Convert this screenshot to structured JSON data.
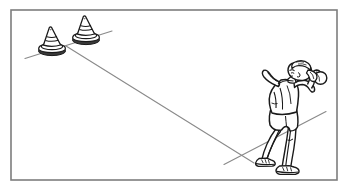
{
  "scene": {
    "type": "line-art-illustration",
    "title": "Overarm throw at cone targets",
    "description": "Black and white line drawing inside a thin rectangular frame. A young person seen from behind stands at the right, feet apart on a ground line, right arm raised holding a small ball ready to throw toward two traffic cones at the upper left. A long thin line shows the throwing path from the cones down to the thrower's position.",
    "background_color": "#ffffff",
    "ink_color": "#1a1a1a",
    "line_color": "#8c8c8c"
  },
  "frame": {
    "name": "picture-border",
    "x": 11,
    "y": 10,
    "width": 326,
    "height": 170,
    "stroke": "#7d7d7d",
    "stroke_width": 1.6
  },
  "cones": [
    {
      "label": "cone-left",
      "apex_x": 49,
      "apex_y": 28,
      "base_center_x": 52,
      "base_center_y": 51,
      "base_rx": 13,
      "base_ry": 4.2,
      "height": 23
    },
    {
      "label": "cone-right",
      "apex_x": 83,
      "apex_y": 17,
      "base_center_x": 86,
      "base_center_y": 40,
      "base_rx": 13,
      "base_ry": 4.2,
      "height": 23
    }
  ],
  "lines": [
    {
      "label": "cone-ground-line",
      "x1": 25,
      "y1": 58,
      "x2": 112,
      "y2": 31
    },
    {
      "label": "throw-path-line",
      "x1": 66,
      "y1": 46,
      "x2": 254,
      "y2": 163
    },
    {
      "label": "thrower-ground-line",
      "x1": 224,
      "y1": 164,
      "x2": 326,
      "y2": 112
    }
  ],
  "figure": {
    "label": "thrower",
    "pose": "overarm-throw-preparation",
    "facing": "away-from-viewer",
    "hair": "ponytail",
    "ball": {
      "label": "ball-in-hand",
      "center_x": 320,
      "center_y": 79,
      "radius": 6.2
    },
    "bounds": {
      "x": 254,
      "y": 62,
      "width": 76,
      "height": 113
    }
  }
}
